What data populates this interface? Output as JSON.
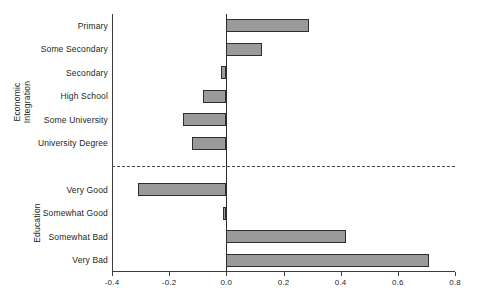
{
  "chart_data": {
    "type": "bar",
    "orientation": "horizontal",
    "title": "",
    "xlabel": "",
    "ylabel": "",
    "xlim": [
      -0.4,
      0.8
    ],
    "xticks": [
      "-0.4",
      "-0.2",
      "0.0",
      "0.2",
      "0.4",
      "0.6",
      "0.8"
    ],
    "xtick_values": [
      -0.4,
      -0.2,
      0.0,
      0.2,
      0.4,
      0.6,
      0.8
    ],
    "grid": false,
    "legend": "none",
    "zero_reference_line": true,
    "group_separator": "dashed",
    "bar_fill_color": "#9a9a9a",
    "bar_edge_color": "#2e2e2e",
    "groups": [
      {
        "name": "Economic\nIntegration",
        "categories": [
          "Primary",
          "Some Secondary",
          "Secondary",
          "High School",
          "Some University",
          "University Degree"
        ],
        "values": [
          0.29,
          0.125,
          -0.02,
          -0.08,
          -0.15,
          -0.12
        ]
      },
      {
        "name": "Education",
        "categories": [
          "Very Good",
          "Somewhat Good",
          "Somewhat Bad",
          "Very Bad"
        ],
        "values": [
          -0.31,
          -0.01,
          0.42,
          0.71
        ]
      }
    ]
  }
}
